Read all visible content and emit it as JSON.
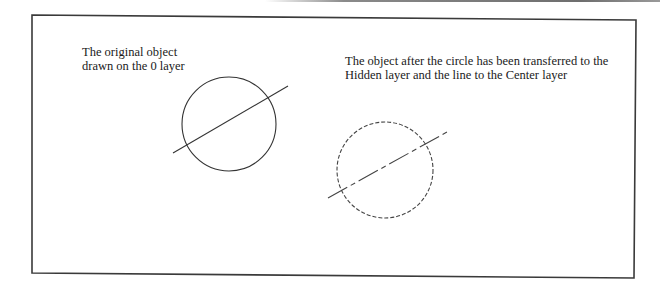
{
  "figure": {
    "left_panel": {
      "caption_lines": [
        "The original object",
        "drawn on the 0 layer"
      ],
      "layer": "0",
      "circle": {
        "cx": 229,
        "cy": 124,
        "r": 47,
        "linetype": "continuous"
      },
      "line": {
        "x1": 173,
        "y1": 153,
        "x2": 288,
        "y2": 86,
        "linetype": "continuous"
      }
    },
    "right_panel": {
      "caption_lines": [
        "The object after the circle has been transferred to the",
        "Hidden layer and the line to the Center layer"
      ],
      "circle": {
        "cx": 385,
        "cy": 170,
        "r": 48,
        "layer": "Hidden",
        "linetype": "hidden"
      },
      "line": {
        "x1": 328,
        "y1": 198,
        "x2": 447,
        "y2": 132,
        "layer": "Center",
        "linetype": "center"
      }
    },
    "colors": {
      "stroke": "#333333",
      "frame": "#3a3a3a",
      "text": "#1a1a1a"
    }
  }
}
